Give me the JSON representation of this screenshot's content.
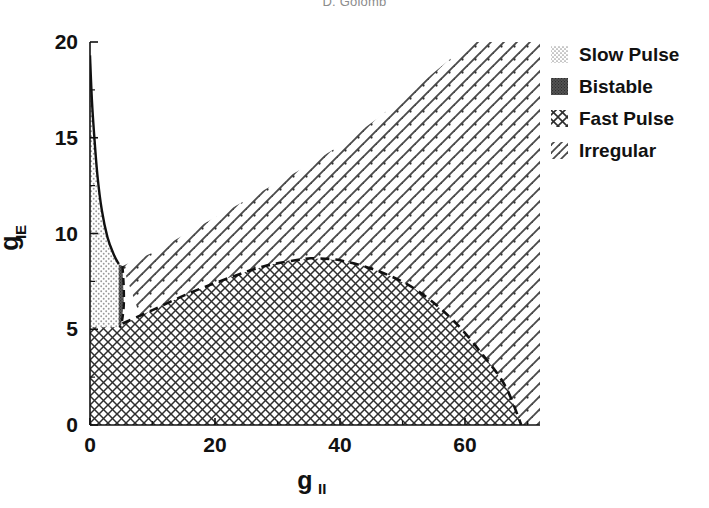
{
  "figure": {
    "cropped_header_text": "D. Golomb",
    "background_color": "#ffffff",
    "foreground_color": "#000000"
  },
  "chart_data": {
    "type": "heatmap",
    "title": "",
    "subtitle": "",
    "xlabel": "g",
    "xlabel_sub": "II",
    "ylabel": "g",
    "ylabel_sub": "IE",
    "xlim": [
      0,
      72
    ],
    "ylim": [
      0,
      20
    ],
    "xticks": [
      0,
      20,
      40,
      60
    ],
    "xticklabels": [
      "0",
      "20",
      "40",
      "60"
    ],
    "yticks": [
      0,
      5,
      10,
      15,
      20
    ],
    "yticklabels": [
      "0",
      "5",
      "10",
      "15",
      "20"
    ],
    "xminorticks": [
      10,
      30,
      50,
      70
    ],
    "yminorticks": [
      2.5,
      7.5,
      12.5,
      17.5
    ],
    "grid": false,
    "legend_position": "outside-top-right",
    "regions": [
      {
        "name": "Slow Pulse",
        "pattern": "light-dots",
        "fill_color": "#b8b8b8",
        "description": "narrow wedge hugging the left axis from gIE~19.3 down to gIE~5",
        "boundary_points": [
          [
            0.0,
            19.3
          ],
          [
            0.3,
            17.0
          ],
          [
            0.7,
            15.0
          ],
          [
            1.2,
            13.0
          ],
          [
            1.9,
            11.2
          ],
          [
            2.8,
            9.8
          ],
          [
            3.8,
            8.9
          ],
          [
            4.7,
            8.4
          ],
          [
            5.0,
            8.2
          ],
          [
            5.0,
            6.6
          ],
          [
            4.9,
            5.6
          ],
          [
            4.6,
            5.1
          ],
          [
            0.0,
            5.1
          ]
        ]
      },
      {
        "name": "Bistable",
        "pattern": "dense-solid",
        "fill_color": "#4a4a4a",
        "description": "very thin sliver along the slow pulse / fast pulse boundary near gII = 5",
        "boundary_points": [
          [
            4.6,
            8.4
          ],
          [
            5.2,
            8.3
          ],
          [
            5.4,
            6.4
          ],
          [
            5.0,
            5.2
          ],
          [
            4.6,
            5.1
          ]
        ]
      },
      {
        "name": "Fast Pulse",
        "pattern": "cross-hatch",
        "fill_color": "#3a3a3a",
        "description": "large lower region bounded above by a dashed arc peaking near gII=36, gIE=8.7 and reaching gIE=0 near gII=69",
        "boundary_points": [
          [
            0.0,
            5.1
          ],
          [
            5.0,
            5.2
          ],
          [
            8.0,
            5.7
          ],
          [
            12.0,
            6.3
          ],
          [
            16.0,
            6.9
          ],
          [
            20.0,
            7.4
          ],
          [
            24.0,
            7.9
          ],
          [
            28.0,
            8.3
          ],
          [
            32.0,
            8.6
          ],
          [
            36.0,
            8.7
          ],
          [
            40.0,
            8.6
          ],
          [
            44.0,
            8.3
          ],
          [
            48.0,
            7.8
          ],
          [
            52.0,
            7.1
          ],
          [
            56.0,
            6.1
          ],
          [
            60.0,
            4.8
          ],
          [
            64.0,
            3.2
          ],
          [
            67.0,
            1.8
          ],
          [
            69.0,
            0.0
          ],
          [
            0.0,
            0.0
          ]
        ]
      },
      {
        "name": "Irregular",
        "pattern": "diagonal-hatch",
        "fill_color": "#555555",
        "description": "upper-right region above the fast pulse arc, rising to gIE=20 at gII=72",
        "boundary_points": [
          [
            5.2,
            8.3
          ],
          [
            10.0,
            9.0
          ],
          [
            16.0,
            10.1
          ],
          [
            22.0,
            11.2
          ],
          [
            28.0,
            12.3
          ],
          [
            34.0,
            13.4
          ],
          [
            40.0,
            14.6
          ],
          [
            46.0,
            16.0
          ],
          [
            52.0,
            17.6
          ],
          [
            58.0,
            19.2
          ],
          [
            61.5,
            20.0
          ],
          [
            72.0,
            20.0
          ],
          [
            72.0,
            0.0
          ],
          [
            69.0,
            0.0
          ],
          [
            64.0,
            3.2
          ],
          [
            60.0,
            4.8
          ],
          [
            56.0,
            6.1
          ],
          [
            52.0,
            7.1
          ],
          [
            48.0,
            7.8
          ],
          [
            44.0,
            8.3
          ],
          [
            40.0,
            8.6
          ],
          [
            36.0,
            8.7
          ],
          [
            32.0,
            8.6
          ],
          [
            28.0,
            8.3
          ],
          [
            24.0,
            7.9
          ],
          [
            20.0,
            7.4
          ],
          [
            16.0,
            6.9
          ],
          [
            12.0,
            6.3
          ],
          [
            8.0,
            5.7
          ]
        ]
      }
    ],
    "curves": [
      {
        "name": "slow-pulse-boundary",
        "style": "solid",
        "points": [
          [
            0.0,
            19.3
          ],
          [
            0.3,
            17.0
          ],
          [
            0.7,
            15.0
          ],
          [
            1.2,
            13.0
          ],
          [
            1.9,
            11.2
          ],
          [
            2.8,
            9.8
          ],
          [
            3.8,
            8.9
          ],
          [
            4.6,
            8.4
          ]
        ]
      },
      {
        "name": "bistable-right-boundary",
        "style": "dashed",
        "points": [
          [
            5.2,
            8.3
          ],
          [
            5.4,
            7.2
          ],
          [
            5.4,
            6.2
          ],
          [
            5.1,
            5.4
          ],
          [
            4.8,
            5.1
          ]
        ]
      },
      {
        "name": "fast-pulse-upper-boundary",
        "style": "dashed",
        "points": [
          [
            5.2,
            5.3
          ],
          [
            10.0,
            6.0
          ],
          [
            16.0,
            6.9
          ],
          [
            22.0,
            7.65
          ],
          [
            28.0,
            8.3
          ],
          [
            34.0,
            8.66
          ],
          [
            36.0,
            8.7
          ],
          [
            40.0,
            8.6
          ],
          [
            46.0,
            8.05
          ],
          [
            52.0,
            7.1
          ],
          [
            58.0,
            5.5
          ],
          [
            63.0,
            3.6
          ],
          [
            66.5,
            2.0
          ],
          [
            69.0,
            0.0
          ]
        ]
      }
    ],
    "legend": [
      {
        "label": "Slow Pulse",
        "pattern": "light-dots",
        "swatch_color": "#b8b8b8"
      },
      {
        "label": "Bistable",
        "pattern": "dense-solid",
        "swatch_color": "#4a4a4a"
      },
      {
        "label": "Fast Pulse",
        "pattern": "cross-hatch",
        "swatch_color": "#3a3a3a"
      },
      {
        "label": "Irregular",
        "pattern": "diagonal-hatch",
        "swatch_color": "#555555"
      }
    ]
  }
}
